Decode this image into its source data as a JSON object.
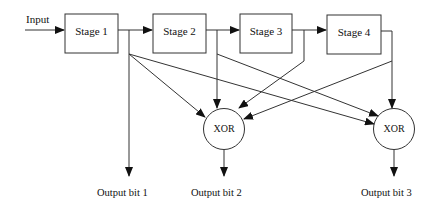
{
  "diagram": {
    "type": "convolutional-encoder",
    "input_label": "Input",
    "stages": [
      {
        "id": "stage1",
        "label": "Stage 1"
      },
      {
        "id": "stage2",
        "label": "Stage 2"
      },
      {
        "id": "stage3",
        "label": "Stage 3"
      },
      {
        "id": "stage4",
        "label": "Stage 4"
      }
    ],
    "xor_gates": [
      {
        "id": "xor1",
        "label": "XOR"
      },
      {
        "id": "xor2",
        "label": "XOR"
      }
    ],
    "outputs": [
      {
        "id": "out1",
        "label": "Output bit 1"
      },
      {
        "id": "out2",
        "label": "Output bit 2"
      },
      {
        "id": "out3",
        "label": "Output bit 3"
      }
    ],
    "edges": [
      {
        "from": "input",
        "to": "stage1"
      },
      {
        "from": "stage1",
        "to": "stage2"
      },
      {
        "from": "stage2",
        "to": "stage3"
      },
      {
        "from": "stage3",
        "to": "stage4"
      },
      {
        "from": "stage1",
        "to": "out1"
      },
      {
        "from": "stage1",
        "to": "xor1"
      },
      {
        "from": "stage1",
        "to": "xor2"
      },
      {
        "from": "stage2",
        "to": "xor1"
      },
      {
        "from": "stage2",
        "to": "xor2"
      },
      {
        "from": "stage3",
        "to": "xor1"
      },
      {
        "from": "stage4",
        "to": "xor1"
      },
      {
        "from": "stage4",
        "to": "xor2"
      },
      {
        "from": "xor1",
        "to": "out2"
      },
      {
        "from": "xor2",
        "to": "out3"
      }
    ]
  }
}
